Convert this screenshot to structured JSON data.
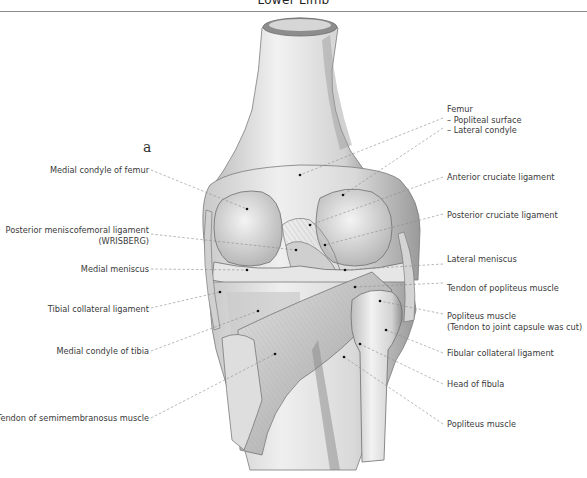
{
  "header": {
    "title": "Lower Limb"
  },
  "figure": {
    "letter": "a"
  },
  "labels_left": [
    {
      "id": "medial-condyle-femur",
      "text": "Medial condyle of femur"
    },
    {
      "id": "posterior-meniscofemoral",
      "text": "Posterior meniscofemoral ligament",
      "sub": "(WRISBERG)"
    },
    {
      "id": "medial-meniscus",
      "text": "Medial meniscus"
    },
    {
      "id": "tibial-collateral",
      "text": "Tibial collateral ligament"
    },
    {
      "id": "medial-condyle-tibia",
      "text": "Medial condyle of tibia"
    },
    {
      "id": "semimembranosus-tendon",
      "text": "Tendon of semimembranosus muscle"
    }
  ],
  "labels_right": [
    {
      "id": "femur",
      "text": "Femur",
      "lines": [
        "– Popliteal surface",
        "– Lateral condyle"
      ]
    },
    {
      "id": "anterior-cruciate",
      "text": "Anterior cruciate ligament"
    },
    {
      "id": "posterior-cruciate",
      "text": "Posterior cruciate ligament"
    },
    {
      "id": "lateral-meniscus",
      "text": "Lateral meniscus"
    },
    {
      "id": "popliteus-tendon",
      "text": "Tendon of popliteus muscle"
    },
    {
      "id": "popliteus-muscle-cut",
      "text": "Popliteus muscle",
      "sub": "(Tendon to joint capsule was cut)"
    },
    {
      "id": "fibular-collateral",
      "text": "Fibular collateral ligament"
    },
    {
      "id": "head-fibula",
      "text": "Head of fibula"
    },
    {
      "id": "popliteus-muscle",
      "text": "Popliteus muscle"
    }
  ]
}
